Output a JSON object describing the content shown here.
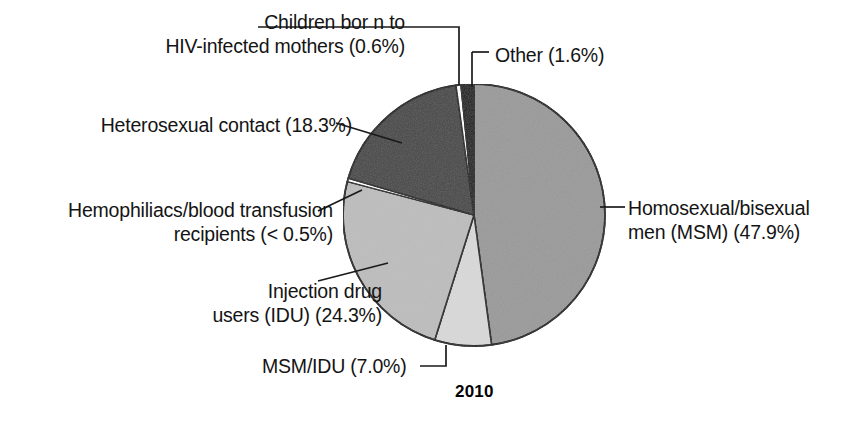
{
  "figure": {
    "caption_year": "2010",
    "background_color": "#ffffff",
    "outline_color": "#1a1a1a"
  },
  "chart_data": {
    "type": "pie",
    "title": "",
    "subtitle": "",
    "caption": "2010",
    "xlabel": "",
    "ylabel": "",
    "legend_position": "none",
    "labels_position": "external-with-leader-lines",
    "grid": false,
    "units": "percent",
    "start_angle_deg": 0,
    "direction": "clockwise",
    "categories": [
      "Homosexual/bisexual men (MSM)",
      "MSM/IDU",
      "Injection drug users (IDU)",
      "Hemophiliacs/blood transfusion recipients",
      "Heterosexual contact",
      "Children born to HIV-infected mothers",
      "Other"
    ],
    "values": [
      47.9,
      7.0,
      24.3,
      0.4,
      18.3,
      0.6,
      1.6
    ],
    "value_labels": [
      "47.9%",
      "7.0%",
      "24.3%",
      "< 0.5%",
      "18.3%",
      "0.6%",
      "1.6%"
    ],
    "colors": [
      "#9a9a9a",
      "#d9d9d9",
      "#bdbdbd",
      "#ffffff",
      "#474747",
      "#ffffff",
      "#1a1a1a"
    ],
    "slices": [
      {
        "name": "Homosexual/bisexual men (MSM)",
        "value": 47.9,
        "value_label": "47.9%",
        "color": "#9a9a9a",
        "label_line1": "Homosexual/bisexual",
        "label_line2": "men (MSM) (47.9%)"
      },
      {
        "name": "MSM/IDU",
        "value": 7.0,
        "value_label": "7.0%",
        "color": "#d9d9d9",
        "label_line1": "MSM/IDU (7.0%)",
        "label_line2": ""
      },
      {
        "name": "Injection drug users (IDU)",
        "value": 24.3,
        "value_label": "24.3%",
        "color": "#bdbdbd",
        "label_line1": "Injection drug",
        "label_line2": "users (IDU) (24.3%)"
      },
      {
        "name": "Hemophiliacs/blood transfusion recipients",
        "value": 0.4,
        "value_label": "< 0.5%",
        "color": "#ffffff",
        "label_line1": "Hemophiliacs/blood transfusion",
        "label_line2": "recipients (< 0.5%)"
      },
      {
        "name": "Heterosexual contact",
        "value": 18.3,
        "value_label": "18.3%",
        "color": "#474747",
        "label_line1": "Heterosexual contact (18.3%)",
        "label_line2": ""
      },
      {
        "name": "Children born to HIV-infected mothers",
        "value": 0.6,
        "value_label": "0.6%",
        "color": "#ffffff",
        "label_line1": "Children bor n to",
        "label_line2": "HIV-infected mothers (0.6%)"
      },
      {
        "name": "Other",
        "value": 1.6,
        "value_label": "1.6%",
        "color": "#1a1a1a",
        "label_line1": "Other (1.6%)",
        "label_line2": ""
      }
    ]
  },
  "labels": {
    "children": {
      "line1": "Children bor n to",
      "line2": "HIV-infected mothers (0.6%)"
    },
    "other": {
      "line1": "Other (1.6%)"
    },
    "heterosexual": {
      "line1": "Heterosexual contact (18.3%)"
    },
    "hemophiliacs": {
      "line1": "Hemophiliacs/blood transfusion",
      "line2": "recipients (< 0.5%)"
    },
    "msm": {
      "line1": "Homosexual/bisexual",
      "line2": "men (MSM) (47.9%)"
    },
    "idu": {
      "line1": "Injection drug",
      "line2": "users (IDU) (24.3%)"
    },
    "msm_idu": {
      "line1": "MSM/IDU (7.0%)"
    }
  }
}
